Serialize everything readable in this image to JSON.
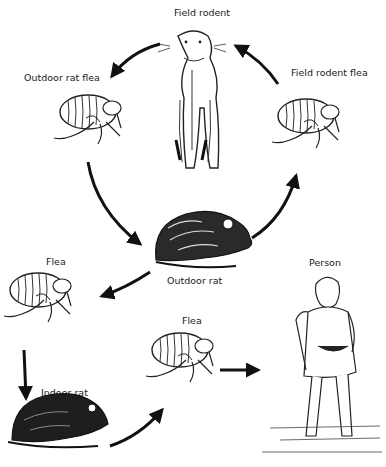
{
  "diagram": {
    "type": "transmission-cycle",
    "nodes": [
      {
        "id": "field_rodent",
        "label": "Field rodent"
      },
      {
        "id": "outdoor_rat_flea",
        "label": "Outdoor rat flea"
      },
      {
        "id": "field_rodent_flea",
        "label": "Field rodent flea"
      },
      {
        "id": "outdoor_rat",
        "label": "Outdoor rat"
      },
      {
        "id": "flea_1",
        "label": "Flea"
      },
      {
        "id": "indoor_rat",
        "label": "Indoor rat"
      },
      {
        "id": "flea_2",
        "label": "Flea"
      },
      {
        "id": "person",
        "label": "Person"
      }
    ],
    "edges": [
      {
        "from": "field_rodent",
        "to": "outdoor_rat_flea"
      },
      {
        "from": "outdoor_rat_flea",
        "to": "outdoor_rat"
      },
      {
        "from": "outdoor_rat",
        "to": "field_rodent_flea"
      },
      {
        "from": "field_rodent_flea",
        "to": "field_rodent"
      },
      {
        "from": "outdoor_rat",
        "to": "flea_1"
      },
      {
        "from": "flea_1",
        "to": "indoor_rat"
      },
      {
        "from": "indoor_rat",
        "to": "flea_2"
      },
      {
        "from": "flea_2",
        "to": "person"
      }
    ]
  },
  "labels": {
    "field_rodent": "Field rodent",
    "outdoor_rat_flea": "Outdoor rat flea",
    "field_rodent_flea": "Field rodent flea",
    "outdoor_rat": "Outdoor rat",
    "flea_1": "Flea",
    "indoor_rat": "Indoor rat",
    "flea_2": "Flea",
    "person": "Person"
  }
}
